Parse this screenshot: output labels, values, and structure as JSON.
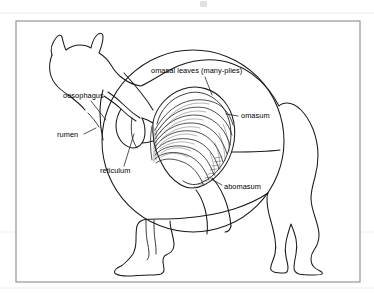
{
  "figure": {
    "view": "left lateral silhouette with cut-away rumen showing omasum",
    "background_color": "#ffffff",
    "ink_color": "#1a1a1a",
    "frame_color": "#8a8a8a"
  },
  "frame": {
    "x": 16,
    "y": 21,
    "width": 344,
    "height": 261
  },
  "labels": {
    "omasal_leaves": "omasal leaves (many-plies)",
    "oesophagus": "oesophagus",
    "rumen": "rumen",
    "reticulum": "reticulum",
    "omasum": "omasum",
    "abomasum": "abomasum"
  },
  "label_positions": {
    "omasal_leaves": {
      "x": 151,
      "y": 73,
      "anchor": "start"
    },
    "oesophagus": {
      "x": 63,
      "y": 98,
      "anchor": "start"
    },
    "rumen": {
      "x": 57,
      "y": 137,
      "anchor": "start"
    },
    "reticulum": {
      "x": 100,
      "y": 173,
      "anchor": "start"
    },
    "omasum": {
      "x": 241,
      "y": 118,
      "anchor": "start"
    },
    "abomasum": {
      "x": 224,
      "y": 189,
      "anchor": "start"
    }
  },
  "rumen_circle": {
    "center_x": 193,
    "center_y": 141,
    "radius": 91
  },
  "omasum_ball": {
    "center_x": 190,
    "center_y": 138,
    "radius_x": 48,
    "radius_y": 52,
    "leaf_count": 9
  },
  "legend_note": "Labelled parts of the ruminant forestomach: oesophagus, rumen, reticulum, omasum with omasal leaves (many-plies), and abomasum."
}
